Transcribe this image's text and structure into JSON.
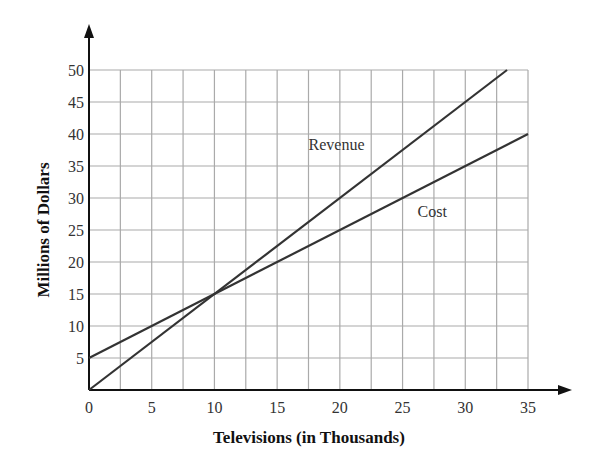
{
  "chart_data": {
    "type": "line",
    "title": "",
    "xlabel": "Televisions (in Thousands)",
    "ylabel": "Millions of Dollars",
    "xlim": [
      0,
      35
    ],
    "ylim": [
      0,
      50
    ],
    "grid": true,
    "x_grid_step": 2.5,
    "y_grid_step": 5,
    "xticks": [
      0,
      5,
      10,
      15,
      20,
      25,
      30,
      35
    ],
    "yticks": [
      5,
      10,
      15,
      20,
      25,
      30,
      35,
      40,
      45,
      50
    ],
    "series": [
      {
        "name": "Revenue",
        "x": [
          0,
          33.33
        ],
        "y": [
          0,
          50
        ],
        "color": "#333333"
      },
      {
        "name": "Cost",
        "x": [
          0,
          35
        ],
        "y": [
          5,
          40
        ],
        "color": "#333333"
      }
    ],
    "annotations": [
      {
        "text": "Revenue",
        "x": 17.5,
        "y": 37.5
      },
      {
        "text": "Cost",
        "x": 26.2,
        "y": 27
      }
    ]
  }
}
